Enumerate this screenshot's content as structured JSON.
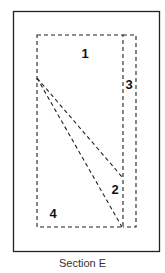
{
  "diagram": {
    "caption": "Section E",
    "outer_border": {
      "x": 13,
      "y": 11,
      "width": 146,
      "height": 240,
      "color": "#222222"
    },
    "regions": [
      {
        "id": "region-1",
        "label": "1",
        "x": 85,
        "y": 53
      },
      {
        "id": "region-2",
        "label": "2",
        "x": 115,
        "y": 189
      },
      {
        "id": "region-3",
        "label": "3",
        "x": 128,
        "y": 84
      },
      {
        "id": "region-4",
        "label": "4",
        "x": 53,
        "y": 213
      }
    ],
    "dashed_lines": {
      "main_rect": {
        "x1": 37,
        "y1": 35,
        "x2": 123,
        "y2": 227
      },
      "strip_3": {
        "x1": 123,
        "y1": 35,
        "x2": 136,
        "y2": 227
      },
      "diagonal_a": {
        "x1": 37,
        "y1": 78,
        "x2": 123,
        "y2": 178
      },
      "diagonal_b": {
        "x1": 37,
        "y1": 78,
        "x2": 122,
        "y2": 227
      }
    },
    "line_color": "#222222"
  }
}
